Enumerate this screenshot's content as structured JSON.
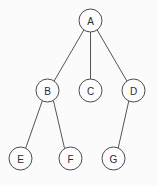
{
  "diagram": {
    "type": "node-link-tree",
    "canvas": {
      "width": 157,
      "height": 186,
      "background": "#fbfbfc"
    },
    "style": {
      "node_fill": "#fdfdfd",
      "node_stroke": "#4a4a4c",
      "node_radius": 11.5,
      "edge_stroke": "#555557",
      "edge_width": 1,
      "label_color": "#2b2b2d",
      "label_size": 10
    },
    "nodes": [
      {
        "id": "A",
        "label": "A",
        "cx": 90.5,
        "cy": 20.5,
        "r": 11.5,
        "level": 0
      },
      {
        "id": "B",
        "label": "B",
        "cx": 47.5,
        "cy": 90.5,
        "r": 11.5,
        "level": 1
      },
      {
        "id": "C",
        "label": "C",
        "cx": 90.5,
        "cy": 90.5,
        "r": 11.5,
        "level": 1
      },
      {
        "id": "D",
        "label": "D",
        "cx": 133.5,
        "cy": 90.5,
        "r": 11.5,
        "level": 1
      },
      {
        "id": "E",
        "label": "E",
        "cx": 20.5,
        "cy": 158.5,
        "r": 11.5,
        "level": 2
      },
      {
        "id": "F",
        "label": "F",
        "cx": 70.5,
        "cy": 158.5,
        "r": 11.5,
        "level": 2
      },
      {
        "id": "G",
        "label": "G",
        "cx": 113.5,
        "cy": 158.5,
        "r": 11.5,
        "level": 2
      }
    ],
    "edges": [
      {
        "id": "A-B",
        "from": "A",
        "to": "B",
        "x1": 83.9,
        "y1": 29.9,
        "x2": 54.1,
        "y2": 81.1
      },
      {
        "id": "A-C",
        "from": "A",
        "to": "C",
        "x1": 90.5,
        "y1": 32.0,
        "x2": 90.5,
        "y2": 79.0
      },
      {
        "id": "A-D",
        "from": "A",
        "to": "D",
        "x1": 97.1,
        "y1": 29.9,
        "x2": 126.9,
        "y2": 81.1
      },
      {
        "id": "B-E",
        "from": "B",
        "to": "E",
        "x1": 42.3,
        "y1": 100.8,
        "x2": 25.7,
        "y2": 148.2
      },
      {
        "id": "B-F",
        "from": "B",
        "to": "F",
        "x1": 53.4,
        "y1": 100.4,
        "x2": 64.6,
        "y2": 148.6
      },
      {
        "id": "D-G",
        "from": "D",
        "to": "G",
        "x1": 128.8,
        "y1": 100.9,
        "x2": 118.2,
        "y2": 148.1
      }
    ]
  }
}
